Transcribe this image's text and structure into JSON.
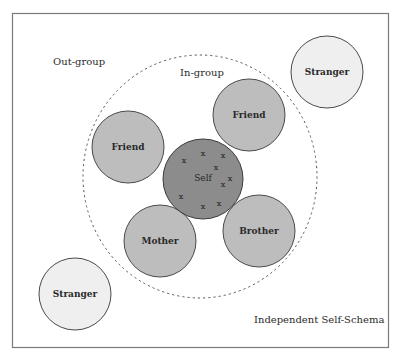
{
  "diagram": {
    "title": "Independent Self-Schema",
    "regions": {
      "out_group": "Out-group",
      "in_group": "In-group"
    },
    "nodes": [
      {
        "id": "self",
        "label": "Self",
        "group": "self",
        "color": "#8c8c8c"
      },
      {
        "id": "friend-left",
        "label": "Friend",
        "group": "in-group",
        "color": "#bdbdbd"
      },
      {
        "id": "friend-right",
        "label": "Friend",
        "group": "in-group",
        "color": "#bdbdbd"
      },
      {
        "id": "mother",
        "label": "Mother",
        "group": "in-group",
        "color": "#bdbdbd"
      },
      {
        "id": "brother",
        "label": "Brother",
        "group": "in-group",
        "color": "#bdbdbd"
      },
      {
        "id": "stranger-top",
        "label": "Stranger",
        "group": "out-group",
        "color": "#efefef"
      },
      {
        "id": "stranger-bottom",
        "label": "Stranger",
        "group": "out-group",
        "color": "#efefef"
      }
    ],
    "self_marks": {
      "symbol": "x",
      "count": 9
    }
  }
}
